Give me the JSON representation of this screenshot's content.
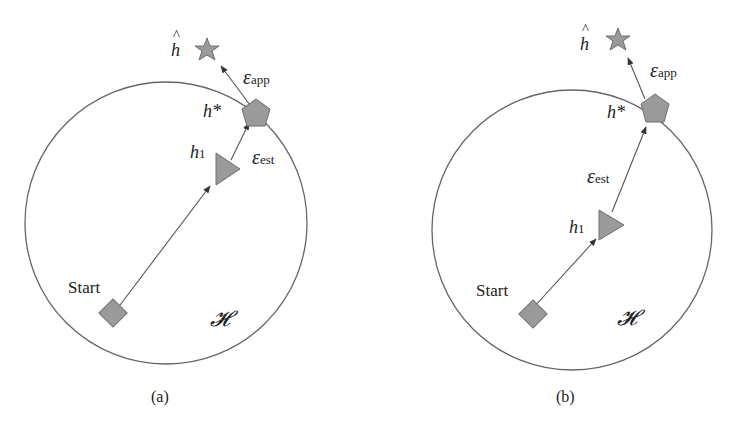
{
  "figure": {
    "panels": [
      {
        "id": "a",
        "caption": "(a)",
        "space_label": "𝓗",
        "start_label": "Start",
        "h1_label": "h",
        "h1_sub": "1",
        "hstar_label": "h*",
        "hhat_label": "h",
        "hat_mark": "^",
        "eps_est_label": "ε",
        "eps_est_sub": "est",
        "eps_app_label": "ε",
        "eps_app_sub": "app"
      },
      {
        "id": "b",
        "caption": "(b)",
        "space_label": "𝓗",
        "start_label": "Start",
        "h1_label": "h",
        "h1_sub": "1",
        "hstar_label": "h*",
        "hhat_label": "h",
        "hat_mark": "^",
        "eps_est_label": "ε",
        "eps_est_sub": "est",
        "eps_app_label": "ε",
        "eps_app_sub": "app"
      }
    ],
    "colors": {
      "shape_fill": "#9a9a9a",
      "shape_stroke": "#6e6e6e",
      "line": "#555555",
      "text": "#222222"
    }
  }
}
